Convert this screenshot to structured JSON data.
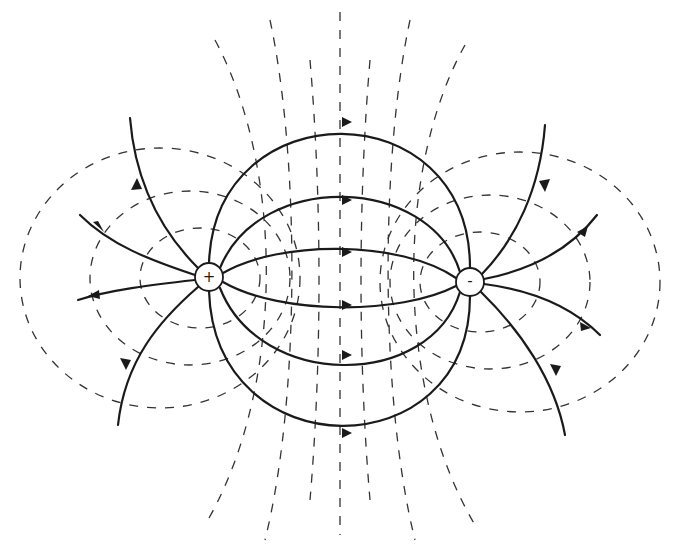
{
  "diagram": {
    "title": "",
    "colors": {
      "ink": "#1a1a1a",
      "dash": "#333333",
      "background": "#ffffff"
    },
    "charges": [
      {
        "id": "positive",
        "label": "+",
        "cx": 209,
        "cy": 277,
        "r": 14
      },
      {
        "id": "negative",
        "label": "-",
        "cx": 470,
        "cy": 282,
        "r": 14
      }
    ],
    "legend": {
      "solid": "electric field lines (arrows from + to -)",
      "dashed": "equipotential lines"
    }
  }
}
